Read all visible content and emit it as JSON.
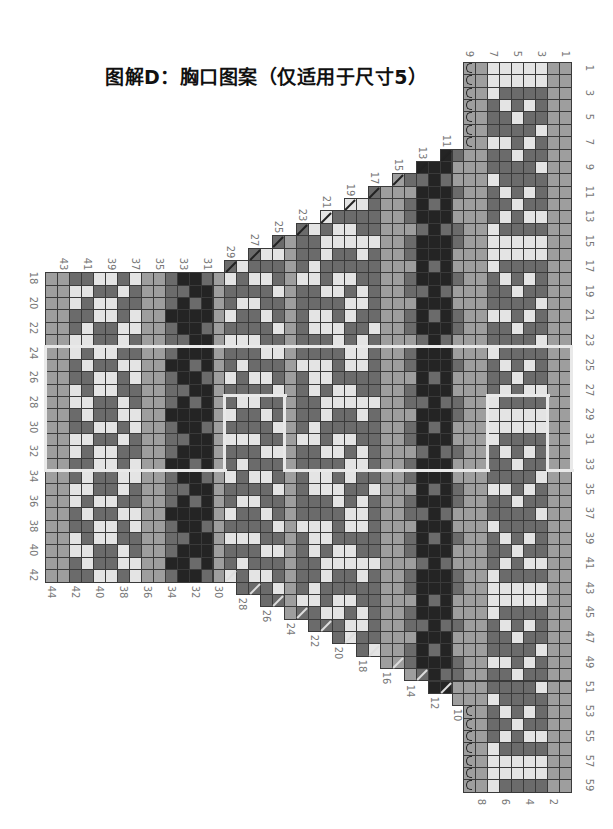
{
  "title": "图解D：胸口图案（仅适用于尺寸5）",
  "geometry": {
    "right": 571,
    "top": 62,
    "cell_w": 11.95,
    "cell_h": 12.37,
    "cols": 44,
    "rows": 59
  },
  "colors": {
    "L": "#c2c2c2",
    "M": "#9e9e9e",
    "D": "#6b6b6b",
    "K": "#242424",
    "W": "#e4e4e4"
  },
  "column_labels_top": [
    1,
    3,
    5,
    7,
    9,
    11,
    13,
    15,
    17,
    19,
    21,
    23,
    25,
    27,
    29,
    31,
    33,
    35,
    37,
    39,
    41,
    43
  ],
  "column_labels_bottom": [
    2,
    4,
    6,
    8,
    10,
    12,
    14,
    16,
    18,
    20,
    22,
    24,
    26,
    28,
    30,
    32,
    34,
    36,
    38,
    40,
    42,
    44
  ],
  "row_labels_right": [
    1,
    3,
    5,
    7,
    9,
    11,
    13,
    15,
    17,
    19,
    21,
    23,
    25,
    27,
    29,
    31,
    33,
    35,
    37,
    39,
    41,
    43,
    45,
    47,
    49,
    51,
    53,
    55,
    57,
    59
  ],
  "row_labels_left": [
    18,
    20,
    22,
    24,
    26,
    28,
    30,
    32,
    34,
    36,
    38,
    40,
    42
  ],
  "columns": [
    {
      "c": 1,
      "top": 1,
      "bottom": 59,
      "pat": "M"
    },
    {
      "c": 2,
      "top": 1,
      "bottom": 59,
      "pat": "M"
    },
    {
      "c": 3,
      "top": 1,
      "bottom": 59,
      "pat": "WWDDDWDDWDDDWD"
    },
    {
      "c": 4,
      "top": 1,
      "bottom": 59,
      "pat": "WWDWDDWDDDWDWD"
    },
    {
      "c": 5,
      "top": 1,
      "bottom": 59,
      "pat": "WWDDWDDWDDDWDD"
    },
    {
      "c": 6,
      "top": 1,
      "bottom": 59,
      "pat": "WWDWDDWDDDWDWD"
    },
    {
      "c": 7,
      "top": 1,
      "bottom": 59,
      "pat": "WWWDDDWDDWDDDW"
    },
    {
      "c": 8,
      "top": 1,
      "bottom": 59,
      "pat": "M"
    },
    {
      "c": 9,
      "top": 1,
      "bottom": 59,
      "pat": "M"
    },
    {
      "c": 10,
      "top": 8,
      "bottom": 52,
      "pat": "DMMDMMD"
    },
    {
      "c": 11,
      "top": 8,
      "bottom": 51,
      "pat": "KKDKKKDKK"
    },
    {
      "c": 12,
      "top": 9,
      "bottom": 51,
      "pat": "KKKDKKKKD"
    },
    {
      "c": 13,
      "top": 9,
      "bottom": 50,
      "pat": "KDKKKDKKK"
    },
    {
      "c": 14,
      "top": 10,
      "bottom": 50,
      "pat": "DMDDMDDMD"
    },
    {
      "c": 15,
      "top": 10,
      "bottom": 49,
      "pat": "M"
    },
    {
      "c": 16,
      "top": 11,
      "bottom": 49,
      "pat": "M"
    },
    {
      "c": 17,
      "top": 11,
      "bottom": 48,
      "pat": "DDDDWDDDDDDWD"
    },
    {
      "c": 18,
      "top": 12,
      "bottom": 48,
      "pat": "WDDWWDDWWDDWW"
    },
    {
      "c": 19,
      "top": 12,
      "bottom": 47,
      "pat": "WDWWDDWDWWDDW"
    },
    {
      "c": 20,
      "top": 13,
      "bottom": 47,
      "pat": "DWWDDWWDDWWDD"
    },
    {
      "c": 21,
      "top": 13,
      "bottom": 46,
      "pat": "WDWWDDWDWWDDW"
    },
    {
      "c": 22,
      "top": 14,
      "bottom": 46,
      "pat": "WDDWWDDWWDDWW"
    },
    {
      "c": 23,
      "top": 14,
      "bottom": 45,
      "pat": "DDDDWDDDDDDWD"
    },
    {
      "c": 24,
      "top": 15,
      "bottom": 45,
      "pat": "M"
    },
    {
      "c": 25,
      "top": 15,
      "bottom": 44,
      "pat": "DWDDWDDW"
    },
    {
      "c": 26,
      "top": 16,
      "bottom": 44,
      "pat": "WDWDDWDD"
    },
    {
      "c": 27,
      "top": 16,
      "bottom": 43,
      "pat": "DDWDWDDW"
    },
    {
      "c": 28,
      "top": 17,
      "bottom": 43,
      "pat": "WDDWDDWD"
    },
    {
      "c": 29,
      "top": 17,
      "bottom": 42,
      "pat": "DWDDWDWD"
    },
    {
      "c": 30,
      "top": 18,
      "bottom": 42,
      "pat": "M"
    },
    {
      "c": 31,
      "top": 18,
      "bottom": 42,
      "pat": "DKKKDKKK"
    },
    {
      "c": 32,
      "top": 18,
      "bottom": 42,
      "pat": "KKDKKKKD"
    },
    {
      "c": 33,
      "top": 18,
      "bottom": 42,
      "pat": "KDKKKDKK"
    },
    {
      "c": 34,
      "top": 18,
      "bottom": 42,
      "pat": "DDDKDDDK"
    },
    {
      "c": 35,
      "top": 18,
      "bottom": 42,
      "pat": "M"
    },
    {
      "c": 36,
      "top": 18,
      "bottom": 42,
      "pat": "M"
    },
    {
      "c": 37,
      "top": 18,
      "bottom": 42,
      "pat": "WDDWWDDWWDDW"
    },
    {
      "c": 38,
      "top": 18,
      "bottom": 42,
      "pat": "DWDDWWDWDDWW"
    },
    {
      "c": 39,
      "top": 18,
      "bottom": 42,
      "pat": "WDWWDDWDWWDD"
    },
    {
      "c": 40,
      "top": 18,
      "bottom": 42,
      "pat": "WDWWDDWDWWDD"
    },
    {
      "c": 41,
      "top": 18,
      "bottom": 42,
      "pat": "DWDDWWDWDDWW"
    },
    {
      "c": 42,
      "top": 18,
      "bottom": 42,
      "pat": "DWWDDWWDDWWD"
    },
    {
      "c": 43,
      "top": 18,
      "bottom": 42,
      "pat": "M"
    },
    {
      "c": 44,
      "top": 18,
      "bottom": 42,
      "pat": "M"
    }
  ],
  "decrease_slashes": [
    {
      "c": 11,
      "r": 8,
      "dir": "up"
    },
    {
      "c": 13,
      "r": 9,
      "dir": "up"
    },
    {
      "c": 15,
      "r": 10,
      "dir": "up"
    },
    {
      "c": 17,
      "r": 11,
      "dir": "up"
    },
    {
      "c": 19,
      "r": 12,
      "dir": "up"
    },
    {
      "c": 21,
      "r": 13,
      "dir": "up"
    },
    {
      "c": 23,
      "r": 14,
      "dir": "up"
    },
    {
      "c": 25,
      "r": 15,
      "dir": "up"
    },
    {
      "c": 27,
      "r": 16,
      "dir": "up"
    },
    {
      "c": 29,
      "r": 17,
      "dir": "up"
    },
    {
      "c": 11,
      "r": 51,
      "dir": "down"
    },
    {
      "c": 13,
      "r": 50,
      "dir": "down"
    },
    {
      "c": 15,
      "r": 49,
      "dir": "down"
    },
    {
      "c": 17,
      "r": 48,
      "dir": "down"
    },
    {
      "c": 19,
      "r": 47,
      "dir": "down"
    },
    {
      "c": 21,
      "r": 46,
      "dir": "down"
    },
    {
      "c": 23,
      "r": 45,
      "dir": "down"
    },
    {
      "c": 25,
      "r": 44,
      "dir": "down"
    },
    {
      "c": 27,
      "r": 43,
      "dir": "down"
    },
    {
      "c": 29,
      "r": 42,
      "dir": "down"
    }
  ],
  "cast_on_marks": {
    "col": 9,
    "rows_top": [
      1,
      2,
      3,
      4,
      5,
      6,
      7
    ],
    "rows_bottom": [
      53,
      54,
      55,
      56,
      57,
      58,
      59
    ]
  },
  "outlines": {
    "main_band": {
      "col_from": 44,
      "col_to": 1,
      "row_from": 24,
      "row_to": 33
    },
    "notch_left": {
      "col_from": 29,
      "col_to": 25,
      "row_from": 28,
      "row_to": 33
    },
    "notch_right": {
      "col_from": 7,
      "col_to": 3,
      "row_from": 28,
      "row_to": 33
    }
  }
}
